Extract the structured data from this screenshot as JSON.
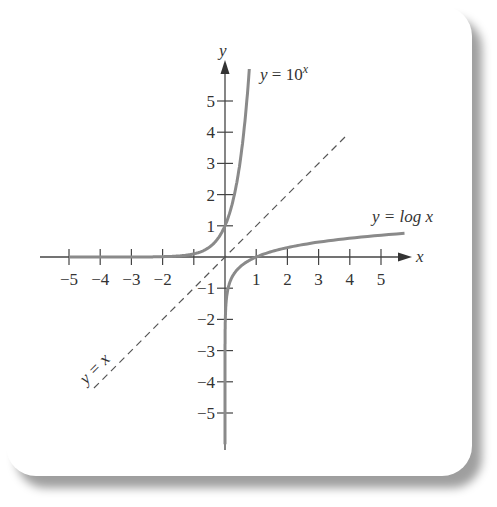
{
  "chart_data": {
    "type": "line",
    "title": "",
    "xlabel": "x",
    "ylabel": "y",
    "xlim": [
      -5.5,
      6
    ],
    "ylim": [
      -6,
      6
    ],
    "x_ticks": [
      -5,
      -4,
      -3,
      -2,
      -1,
      1,
      2,
      3,
      4,
      5
    ],
    "x_tick_labels": [
      "−5",
      "−4",
      "−3",
      "−2",
      "",
      "1",
      "2",
      "3",
      "4",
      "5"
    ],
    "y_ticks": [
      -5,
      -4,
      -3,
      -2,
      -1,
      1,
      2,
      3,
      4,
      5
    ],
    "y_tick_labels": [
      "−5",
      "−4",
      "−3",
      "−2",
      "−1",
      "1",
      "2",
      "3",
      "4",
      "5"
    ],
    "grid": false,
    "legend": null,
    "series": [
      {
        "name": "y = 10^x",
        "style": "solid",
        "color": "#8a8a8a",
        "x": [
          -5,
          -3,
          -2,
          -1,
          -0.5,
          0,
          0.3,
          0.5,
          0.7,
          0.78
        ],
        "y": [
          1e-05,
          0.001,
          0.01,
          0.1,
          0.316,
          1,
          1.995,
          3.162,
          5.012,
          6.0
        ]
      },
      {
        "name": "y = log x",
        "style": "solid",
        "color": "#8a8a8a",
        "x": [
          1e-06,
          1e-05,
          0.001,
          0.1,
          0.5,
          1,
          2,
          3,
          4,
          5,
          6
        ],
        "y": [
          -6,
          -5,
          -3,
          -1,
          -0.301,
          0,
          0.301,
          0.477,
          0.602,
          0.699,
          0.778
        ]
      },
      {
        "name": "y = x",
        "style": "dashed",
        "color": "#555555",
        "x": [
          -4.2,
          3.9
        ],
        "y": [
          -4.2,
          3.9
        ]
      }
    ],
    "annotations": [
      {
        "text": "y = 10^x",
        "x": 1.1,
        "y": 5.6
      },
      {
        "text": "y = log x",
        "x": 4.8,
        "y": 1.1
      },
      {
        "text": "y = x",
        "x": -4.2,
        "y": -3.3,
        "rotation": -45
      }
    ]
  },
  "labels": {
    "x_axis": "x",
    "y_axis": "y",
    "exp_label_base": "y = 10",
    "exp_label_sup": "x",
    "log_label": "y = log x",
    "identity_label": "y = x"
  }
}
